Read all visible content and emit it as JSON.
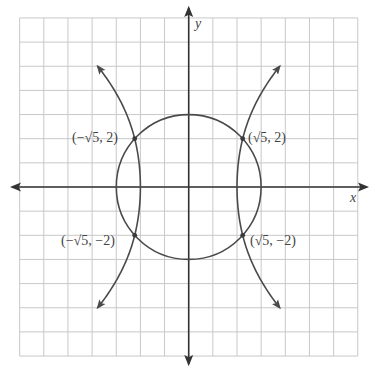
{
  "diagram": {
    "type": "coordinate-plane",
    "axes": {
      "x_label": "x",
      "y_label": "y",
      "x_range": [
        -7,
        7
      ],
      "y_range": [
        -7,
        7
      ],
      "grid": true
    },
    "curves": [
      {
        "name": "circle",
        "description": "circle centered at origin, radius 3",
        "radius": 3
      },
      {
        "name": "hyperbola",
        "description": "hyperbola opening left/right with vertices at (±2, 0), arrows at both ends of each branch",
        "vertex_x": 2
      }
    ],
    "intersection_points": [
      {
        "label": "(−√5, 2)",
        "x": -2.236,
        "y": 2
      },
      {
        "label": "(√5, 2)",
        "x": 2.236,
        "y": 2
      },
      {
        "label": "(−√5, −2)",
        "x": -2.236,
        "y": -2
      },
      {
        "label": "(√5, −2)",
        "x": 2.236,
        "y": -2
      }
    ]
  },
  "colors": {
    "grid": "#c8c8c8",
    "axis": "#333333",
    "curve": "#4a4a4a",
    "text": "#444444"
  }
}
